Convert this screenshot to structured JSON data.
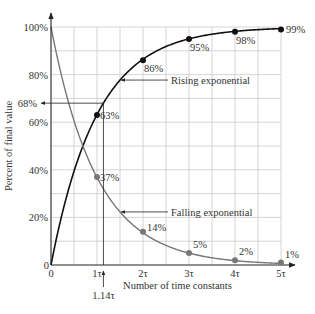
{
  "chart_data": {
    "type": "line",
    "title": "",
    "xlabel": "Number of time constants",
    "ylabel": "Percent of final value",
    "xlim": [
      0,
      5
    ],
    "ylim": [
      0,
      100
    ],
    "grid": true,
    "x_grid_step": 0.5,
    "y_grid_step": 10,
    "x_ticks": [
      {
        "value": 0,
        "label": "0"
      },
      {
        "value": 1,
        "label": "1τ"
      },
      {
        "value": 2,
        "label": "2τ"
      },
      {
        "value": 3,
        "label": "3τ"
      },
      {
        "value": 4,
        "label": "4τ"
      },
      {
        "value": 5,
        "label": "5τ"
      }
    ],
    "y_ticks": [
      {
        "value": 0,
        "label": "0"
      },
      {
        "value": 20,
        "label": "20%"
      },
      {
        "value": 40,
        "label": "40%"
      },
      {
        "value": 60,
        "label": "60%"
      },
      {
        "value": 80,
        "label": "80%"
      },
      {
        "value": 100,
        "label": "100%"
      }
    ],
    "series": [
      {
        "name": "Rising exponential",
        "function": "100*(1-exp(-x))",
        "color": "#111111",
        "points": [
          {
            "x": 1,
            "y": 63,
            "label": "63%"
          },
          {
            "x": 2,
            "y": 86,
            "label": "86%"
          },
          {
            "x": 3,
            "y": 95,
            "label": "95%"
          },
          {
            "x": 4,
            "y": 98,
            "label": "98%"
          },
          {
            "x": 5,
            "y": 99,
            "label": "99%"
          }
        ]
      },
      {
        "name": "Falling exponential",
        "function": "100*exp(-x)",
        "color": "#777777",
        "points": [
          {
            "x": 1,
            "y": 37,
            "label": "37%"
          },
          {
            "x": 2,
            "y": 14,
            "label": "14%"
          },
          {
            "x": 3,
            "y": 5,
            "label": "5%"
          },
          {
            "x": 4,
            "y": 2,
            "label": "2%"
          },
          {
            "x": 5,
            "y": 1,
            "label": "1%"
          }
        ]
      }
    ],
    "annotations": [
      {
        "type": "callout",
        "text": "Rising exponential",
        "target": {
          "x": 1.5,
          "y": 77.7
        }
      },
      {
        "type": "callout",
        "text": "Falling exponential",
        "target": {
          "x": 1.5,
          "y": 22.3
        }
      },
      {
        "type": "reference",
        "y": 68,
        "y_label": "68%",
        "x": 1.14,
        "x_label": "1.14τ"
      }
    ]
  }
}
